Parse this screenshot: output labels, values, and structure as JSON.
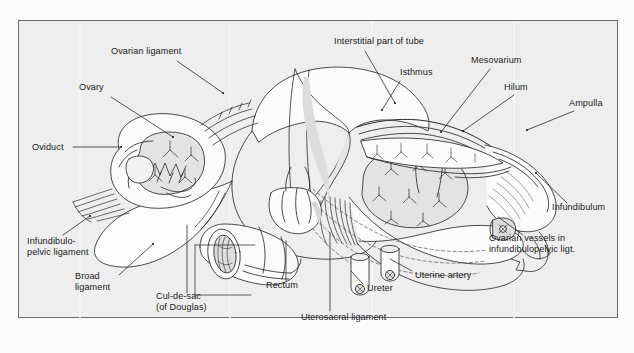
{
  "figure": {
    "kind": "anatomical-line-drawing",
    "frame": {
      "x": 18,
      "y": 20,
      "width": 600,
      "height": 298,
      "border_color": "#6b6b6b",
      "fill_color": "#eeeeee"
    },
    "ink_color": "#2b2b2b",
    "shade_color": "#d8d8d8",
    "page_background": "#fcfcfc"
  },
  "labels": [
    {
      "id": "ovarian-ligament",
      "text": "Ovarian ligament",
      "x": 110,
      "y": 47,
      "align": "left",
      "line": [
        [
          176,
          58
        ],
        [
          222,
          90
        ]
      ]
    },
    {
      "id": "ovary",
      "text": "Ovary",
      "x": 78,
      "y": 83,
      "align": "left",
      "line": [
        [
          110,
          94
        ],
        [
          172,
          134
        ]
      ]
    },
    {
      "id": "oviduct",
      "text": "Oviduct",
      "x": 31,
      "y": 143,
      "align": "left",
      "line": [
        [
          72,
          148
        ],
        [
          120,
          148
        ]
      ]
    },
    {
      "id": "infundibulopelvic-ligament",
      "text": "Infundibulo-\npelvic ligament",
      "x": 26,
      "y": 237,
      "align": "left",
      "line": [
        [
          62,
          232
        ],
        [
          89,
          213
        ]
      ]
    },
    {
      "id": "broad-ligament",
      "text": "Broad\nligament",
      "x": 74,
      "y": 272,
      "align": "left",
      "line": [
        [
          118,
          272
        ],
        [
          152,
          241
        ]
      ]
    },
    {
      "id": "cul-de-sac",
      "text": "Cul-de-sac\n(of Douglas)",
      "x": 155,
      "y": 292,
      "align": "left",
      "line": [
        [
          186,
          290
        ],
        [
          186,
          222
        ]
      ]
    },
    {
      "id": "rectum",
      "text": "Rectum",
      "x": 265,
      "y": 281,
      "align": "left",
      "line": [
        [
          285,
          278
        ],
        [
          285,
          238
        ]
      ]
    },
    {
      "id": "uterosacral-ligament",
      "text": "Uterosacral ligament",
      "x": 300,
      "y": 313,
      "align": "left",
      "line": [
        [
          329,
          308
        ],
        [
          329,
          230
        ]
      ]
    },
    {
      "id": "ureter",
      "text": "Ureter",
      "x": 366,
      "y": 284,
      "align": "left",
      "line": [
        [
          362,
          281
        ],
        [
          350,
          268
        ]
      ]
    },
    {
      "id": "uterine-artery",
      "text": "Uterine artery",
      "x": 414,
      "y": 271,
      "align": "left",
      "line": [
        [
          411,
          268
        ],
        [
          389,
          256
        ]
      ]
    },
    {
      "id": "interstitial-part-of-tube",
      "text": "Interstitial part of tube",
      "x": 333,
      "y": 37,
      "align": "left",
      "line": [
        [
          364,
          48
        ],
        [
          394,
          100
        ]
      ]
    },
    {
      "id": "isthmus",
      "text": "Isthmus",
      "x": 399,
      "y": 68,
      "align": "left",
      "line": [
        [
          411,
          78
        ],
        [
          393,
          107
        ]
      ]
    },
    {
      "id": "mesovarium",
      "text": "Mesovarium",
      "x": 470,
      "y": 56,
      "align": "left",
      "line": [
        [
          489,
          66
        ],
        [
          440,
          129
        ]
      ]
    },
    {
      "id": "hilum",
      "text": "Hilum",
      "x": 503,
      "y": 83,
      "align": "left",
      "line": [
        [
          513,
          92
        ],
        [
          462,
          128
        ]
      ]
    },
    {
      "id": "ampulla",
      "text": "Ampulla",
      "x": 568,
      "y": 99,
      "align": "left",
      "line": [
        [
          573,
          108
        ],
        [
          526,
          127
        ]
      ]
    },
    {
      "id": "infundibulum",
      "text": "Infundibulum",
      "x": 551,
      "y": 203,
      "align": "left",
      "line": [
        [
          566,
          200
        ],
        [
          535,
          170
        ]
      ]
    },
    {
      "id": "ovarian-vessels",
      "text": "Ovarian vessels in\ninfundibulopelvic ligt.",
      "x": 488,
      "y": 234,
      "align": "left",
      "line": [
        [
          522,
          232
        ],
        [
          497,
          214
        ]
      ]
    }
  ]
}
